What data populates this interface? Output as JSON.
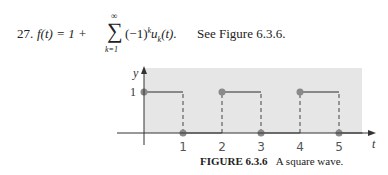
{
  "exercise": {
    "number": "27.",
    "lhs": "f(t) = 1 +",
    "sum_upper": "∞",
    "sum_lower": "k=1",
    "term_base": "(−1)",
    "term_exp": "k",
    "term_u": "u",
    "term_sub": "k",
    "term_arg": "(t).",
    "see_text": "See Figure 6.3.6."
  },
  "figure": {
    "label": "FIGURE 6.3.6",
    "caption": "A square wave."
  },
  "chart_data": {
    "type": "line",
    "title": "",
    "xlabel": "t",
    "ylabel": "y",
    "xlim": [
      -0.1,
      5.6
    ],
    "ylim": [
      0,
      1.6
    ],
    "x_ticks": [
      "1",
      "2",
      "3",
      "4",
      "5"
    ],
    "y_ticks": [
      "1"
    ],
    "series": [
      {
        "name": "f(t)",
        "segments": [
          {
            "x": [
              0,
              1
            ],
            "y": [
              1,
              1
            ]
          },
          {
            "x": [
              1,
              2
            ],
            "y": [
              0,
              0
            ]
          },
          {
            "x": [
              2,
              3
            ],
            "y": [
              1,
              1
            ]
          },
          {
            "x": [
              3,
              4
            ],
            "y": [
              0,
              0
            ]
          },
          {
            "x": [
              4,
              5
            ],
            "y": [
              1,
              1
            ]
          },
          {
            "x": [
              5,
              5.6
            ],
            "y": [
              0,
              0
            ]
          }
        ],
        "dashed_jumps": [
          1,
          2,
          3,
          4,
          5
        ],
        "closed_points": [
          [
            0,
            1
          ],
          [
            1,
            0
          ],
          [
            2,
            1
          ],
          [
            3,
            0
          ],
          [
            4,
            1
          ],
          [
            5,
            0
          ]
        ]
      }
    ],
    "shaded_background": true,
    "colors": {
      "shade": "#e6e6e6",
      "line": "#888888",
      "point": "#8a8a8a",
      "axis": "#333333"
    }
  }
}
